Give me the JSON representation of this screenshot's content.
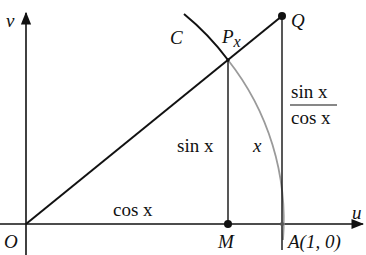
{
  "diagram": {
    "type": "geometry",
    "axes": {
      "horizontal_label": "u",
      "vertical_label": "v",
      "origin_label": "O"
    },
    "points": {
      "origin": "O",
      "point_on_circle": "P",
      "point_on_circle_subscript": "x",
      "tangent_point": "Q",
      "foot": "M",
      "unit_point": "A(1, 0)"
    },
    "curve_label": "C",
    "segment_labels": {
      "base": "cos x",
      "height": "sin x",
      "arc": "x",
      "tangent_numerator": "sin x",
      "tangent_denominator": "cos x"
    },
    "colors": {
      "line": "#111111",
      "arc_inside": "#9a9a9a"
    }
  }
}
